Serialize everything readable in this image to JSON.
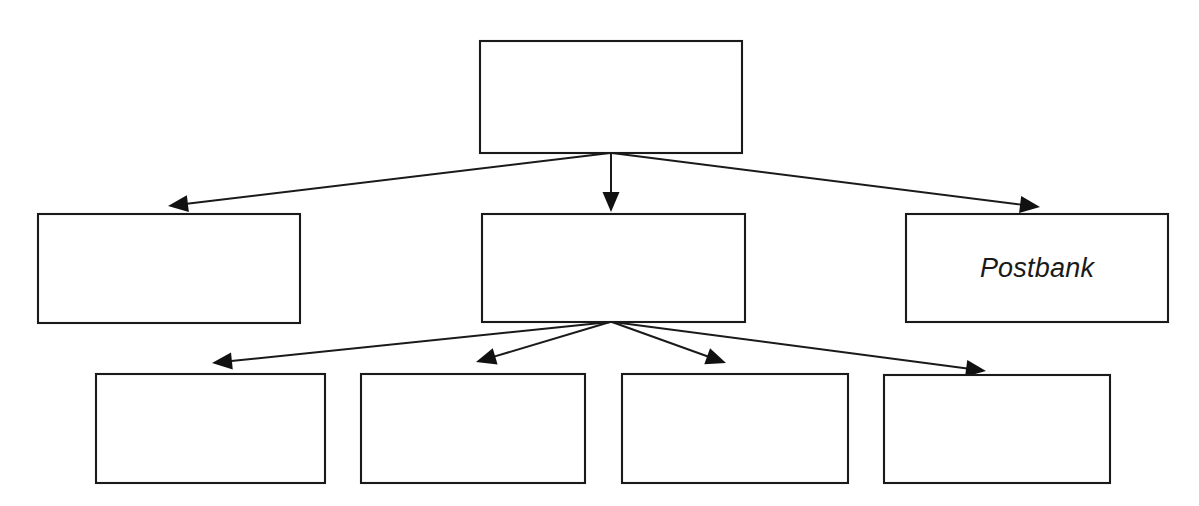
{
  "diagram": {
    "kind": "org-hierarchy-tree",
    "background_color": "#ffffff",
    "line_color": "#1a1a1a",
    "box_fill": "#ffffff",
    "levels": 3,
    "nodes": [
      {
        "id": "root",
        "level": 0,
        "label": "",
        "x": 480,
        "y": 41,
        "width": 262,
        "height": 112
      },
      {
        "id": "child-left",
        "level": 1,
        "label": "",
        "x": 38,
        "y": 214,
        "width": 262,
        "height": 109
      },
      {
        "id": "child-center",
        "level": 1,
        "label": "",
        "x": 482,
        "y": 214,
        "width": 263,
        "height": 108
      },
      {
        "id": "child-right",
        "level": 1,
        "label": "Postbank",
        "x": 906,
        "y": 214,
        "width": 262,
        "height": 108
      },
      {
        "id": "grandchild-1",
        "level": 2,
        "label": "",
        "x": 96,
        "y": 374,
        "width": 229,
        "height": 109
      },
      {
        "id": "grandchild-2",
        "level": 2,
        "label": "",
        "x": 361,
        "y": 374,
        "width": 224,
        "height": 109
      },
      {
        "id": "grandchild-3",
        "level": 2,
        "label": "",
        "x": 622,
        "y": 374,
        "width": 226,
        "height": 109
      },
      {
        "id": "grandchild-4",
        "level": 2,
        "label": "",
        "x": 884,
        "y": 375,
        "width": 226,
        "height": 108
      }
    ],
    "edges": [
      {
        "id": "edge-root-left",
        "from": "root",
        "to": "child-left",
        "x1": 610,
        "y1": 153,
        "x2": 168,
        "y2": 206,
        "arrow": "end"
      },
      {
        "id": "edge-root-center",
        "from": "root",
        "to": "child-center",
        "x1": 611,
        "y1": 153,
        "x2": 611,
        "y2": 212,
        "arrow": "end"
      },
      {
        "id": "edge-root-right",
        "from": "root",
        "to": "child-right",
        "x1": 612,
        "y1": 153,
        "x2": 1040,
        "y2": 207,
        "arrow": "end"
      },
      {
        "id": "edge-center-g1",
        "from": "child-center",
        "to": "grandchild-1",
        "x1": 610,
        "y1": 322,
        "x2": 212,
        "y2": 363,
        "arrow": "end"
      },
      {
        "id": "edge-center-g2",
        "from": "child-center",
        "to": "grandchild-2",
        "x1": 610,
        "y1": 322,
        "x2": 476,
        "y2": 362,
        "arrow": "end"
      },
      {
        "id": "edge-center-g3",
        "from": "child-center",
        "to": "grandchild-3",
        "x1": 612,
        "y1": 322,
        "x2": 726,
        "y2": 363,
        "arrow": "end"
      },
      {
        "id": "edge-center-g4",
        "from": "child-center",
        "to": "grandchild-4",
        "x1": 613,
        "y1": 322,
        "x2": 986,
        "y2": 371,
        "arrow": "end"
      }
    ]
  }
}
